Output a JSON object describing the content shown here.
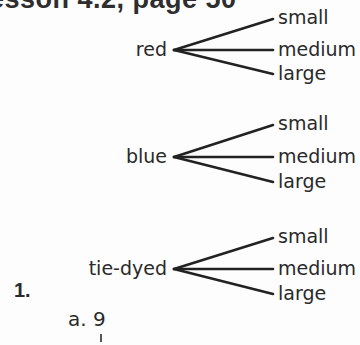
{
  "heading": {
    "text": "Lesson 4.2, page 50"
  },
  "trees": [
    {
      "root": "red",
      "branches": [
        "small",
        "medium",
        "large"
      ]
    },
    {
      "root": "blue",
      "branches": [
        "small",
        "medium",
        "large"
      ]
    },
    {
      "root": "tie-dyed",
      "branches": [
        "small",
        "medium",
        "large"
      ]
    }
  ],
  "problem": {
    "number": "1.",
    "sub_label": "a.",
    "answer": "9"
  }
}
